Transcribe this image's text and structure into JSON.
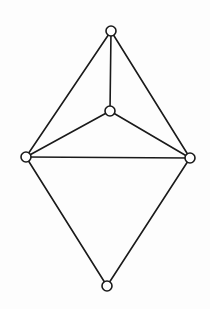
{
  "diagram": {
    "type": "graph",
    "width": 210,
    "height": 309,
    "background": "#fdfdfd",
    "stroke_color": "#1a1a1a",
    "stroke_width": 1.6,
    "node_radius": 5,
    "node_fill": "#ffffff",
    "nodes": [
      {
        "id": "top",
        "x": 111,
        "y": 31
      },
      {
        "id": "center",
        "x": 110,
        "y": 111
      },
      {
        "id": "left",
        "x": 26,
        "y": 157
      },
      {
        "id": "right",
        "x": 190,
        "y": 158
      },
      {
        "id": "bottom",
        "x": 107,
        "y": 286
      }
    ],
    "edges": [
      {
        "from": "top",
        "to": "left"
      },
      {
        "from": "top",
        "to": "right"
      },
      {
        "from": "top",
        "to": "center"
      },
      {
        "from": "center",
        "to": "left"
      },
      {
        "from": "center",
        "to": "right"
      },
      {
        "from": "left",
        "to": "right"
      },
      {
        "from": "left",
        "to": "bottom"
      },
      {
        "from": "right",
        "to": "bottom"
      }
    ]
  }
}
